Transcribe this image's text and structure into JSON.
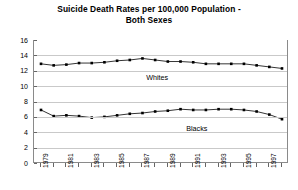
{
  "chart_data": {
    "type": "line",
    "title": "Suicide Death Rates per 100,000 Population - Both Sexes",
    "title_lines": [
      "Suicide Death Rates per 100,000 Population -",
      "Both Sexes"
    ],
    "xlabel": "",
    "ylabel": "",
    "ylim": [
      0,
      16
    ],
    "ytick_values": [
      0,
      2,
      4,
      6,
      8,
      10,
      12,
      14,
      16
    ],
    "ytick_labels": [
      "0",
      "2",
      "4",
      "6",
      "8",
      "10",
      "12",
      "14",
      "16"
    ],
    "grid": true,
    "legend_position": "inline-annotation",
    "x": [
      1979,
      1980,
      1981,
      1982,
      1983,
      1984,
      1985,
      1986,
      1987,
      1988,
      1989,
      1990,
      1991,
      1992,
      1993,
      1994,
      1995,
      1996,
      1997,
      1998
    ],
    "xtick_labels": [
      "1979",
      "",
      "1981",
      "",
      "1983",
      "",
      "1985",
      "",
      "1987",
      "",
      "1989",
      "",
      "1991",
      "",
      "1993",
      "",
      "1995",
      "",
      "1997",
      ""
    ],
    "series": [
      {
        "name": "Whites",
        "annotation": "Whites",
        "values": [
          12.9,
          12.7,
          12.8,
          13.0,
          13.0,
          13.1,
          13.3,
          13.4,
          13.6,
          13.4,
          13.2,
          13.2,
          13.1,
          12.9,
          12.9,
          12.9,
          12.9,
          12.7,
          12.5,
          12.3
        ]
      },
      {
        "name": "Blacks",
        "annotation": "Blacks",
        "values": [
          6.9,
          6.1,
          6.2,
          6.1,
          5.9,
          6.0,
          6.2,
          6.4,
          6.5,
          6.7,
          6.8,
          7.0,
          6.9,
          6.9,
          7.0,
          7.0,
          6.9,
          6.7,
          6.3,
          5.7
        ]
      }
    ]
  }
}
